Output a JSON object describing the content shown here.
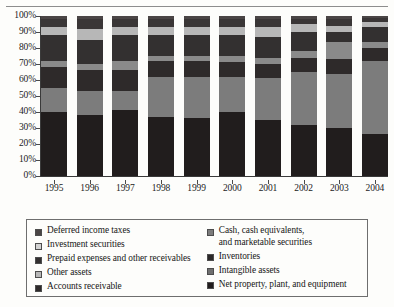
{
  "chart_data": {
    "type": "bar",
    "subtype": "stacked-percent-bar",
    "title": "",
    "xlabel": "",
    "ylabel": "",
    "ylim": [
      0,
      100
    ],
    "ytick_labels": [
      "0%",
      "10%",
      "20%",
      "30%",
      "40%",
      "50%",
      "60%",
      "70%",
      "80%",
      "90%",
      "100%"
    ],
    "ytick_values": [
      0,
      10,
      20,
      30,
      40,
      50,
      60,
      70,
      80,
      90,
      100
    ],
    "grid": false,
    "legend_position": "bottom",
    "categories": [
      "1995",
      "1996",
      "1997",
      "1998",
      "1999",
      "2000",
      "2001",
      "2002",
      "2003",
      "2004"
    ],
    "stack_order_bottom_to_top": [
      "Net property, plant, and equipment",
      "Cash, cash equivalents, and marketable securities",
      "Accounts receivable",
      "Inventories",
      "Prepaid expenses and other receivables",
      "Investment securities",
      "Intangible assets",
      "Deferred income taxes"
    ],
    "series": [
      {
        "name": "Net property, plant, and equipment",
        "color": "#211d1d",
        "values": [
          40,
          38,
          41,
          37,
          36,
          40,
          35,
          32,
          30,
          26
        ]
      },
      {
        "name": "Cash, cash equivalents, and marketable securities",
        "color": "#7c7c7c",
        "values": [
          15,
          15,
          12,
          25,
          26,
          22,
          26,
          33,
          34,
          46
        ]
      },
      {
        "name": "Accounts receivable",
        "color": "#2e2a2a",
        "values": [
          13,
          13,
          13,
          10,
          10,
          9,
          9,
          9,
          9,
          8
        ]
      },
      {
        "name": "Inventories",
        "color": "#8a8a8a",
        "values": [
          4,
          4,
          6,
          3,
          3,
          4,
          4,
          4,
          11,
          4
        ]
      },
      {
        "name": "Prepaid expenses and other receivables",
        "color": "#333030",
        "values": [
          16,
          15,
          16,
          13,
          13,
          13,
          13,
          12,
          6,
          9
        ]
      },
      {
        "name": "Investment securities",
        "color": "#b7b7b7",
        "values": [
          5,
          7,
          5,
          5,
          5,
          5,
          6,
          5,
          4,
          3
        ]
      },
      {
        "name": "Intangible assets",
        "color": "#3a3636",
        "values": [
          5,
          6,
          5,
          5,
          5,
          5,
          5,
          3,
          4,
          3
        ]
      },
      {
        "name": "Deferred income taxes",
        "color": "#4a4545",
        "values": [
          2,
          2,
          2,
          2,
          2,
          2,
          2,
          2,
          2,
          1
        ]
      }
    ]
  },
  "legend": {
    "left_column": [
      {
        "label": "Deferred income taxes",
        "color": "#4a4545"
      },
      {
        "label": "Investment securities",
        "color": "#d2d2d2"
      },
      {
        "label": "Prepaid expenses and other receivables",
        "color": "#333030"
      },
      {
        "label": "Other assets",
        "color": "#b7b7b7"
      },
      {
        "label": "Accounts receivable",
        "color": "#2e2a2a"
      }
    ],
    "right_column": [
      {
        "label": "Cash, cash equivalents,\nand marketable securities",
        "color": "#7c7c7c"
      },
      {
        "label": "Inventories",
        "color": "#2b2828"
      },
      {
        "label": "Intangible assets",
        "color": "#6f6f6f"
      },
      {
        "label": "Net property, plant, and equipment",
        "color": "#211d1d"
      }
    ]
  }
}
